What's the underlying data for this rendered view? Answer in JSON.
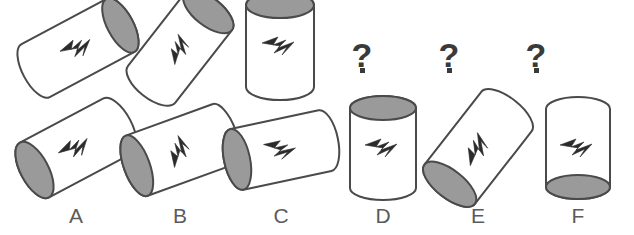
{
  "puzzle": {
    "type": "mental-rotation-multiple-choice",
    "background_color": "#ffffff",
    "stroke_color": "#4a4a4a",
    "body_fill": "#ffffff",
    "cap_fill": "#9a9a9a",
    "bolt_fill": "#2b2b2b",
    "label_color": "#5b5b5b",
    "question_mark_color": "#3a3a3a"
  },
  "top_row": {
    "name": "question-sequence",
    "items": [
      {
        "id": "q1",
        "kind": "cylinder",
        "x": 78,
        "y": 48,
        "rotation_deg": -28,
        "cap_side": "right",
        "bolt_angle_deg": -20,
        "bolt_scale": 1.0,
        "rx": 48,
        "ry": 30,
        "cap_rx": 13,
        "cap_ry": 30
      },
      {
        "id": "q2",
        "kind": "cylinder",
        "x": 180,
        "y": 48,
        "rotation_deg": -52,
        "cap_side": "right",
        "bolt_angle_deg": -82,
        "bolt_scale": 0.95,
        "rx": 46,
        "ry": 30,
        "cap_rx": 14,
        "cap_ry": 30
      },
      {
        "id": "q3",
        "kind": "cylinder",
        "x": 280,
        "y": 46,
        "rotation_deg": -90,
        "cap_side": "right",
        "bolt_angle_deg": 0,
        "bolt_scale": 1.0,
        "rx": 41,
        "ry": 34,
        "cap_rx": 13,
        "cap_ry": 34
      },
      {
        "id": "q4",
        "kind": "question-mark",
        "label": "?",
        "x": 362,
        "y": 38
      },
      {
        "id": "q5",
        "kind": "question-mark",
        "label": "?",
        "x": 449,
        "y": 38
      },
      {
        "id": "q6",
        "kind": "question-mark",
        "label": "?",
        "x": 536,
        "y": 38
      }
    ]
  },
  "bottom_row": {
    "name": "answer-options",
    "options": [
      {
        "id": "A",
        "label": "A",
        "x": 76,
        "y": 148,
        "label_x": 76,
        "label_y": 205,
        "rotation_deg": 152,
        "cap_side": "right",
        "bolt_angle_deg": -25,
        "bolt_scale": 1.0,
        "rx": 47,
        "ry": 31,
        "cap_rx": 14,
        "cap_ry": 31
      },
      {
        "id": "B",
        "label": "B",
        "x": 180,
        "y": 150,
        "label_x": 180,
        "label_y": 205,
        "rotation_deg": 160,
        "cap_side": "right",
        "bolt_angle_deg": -82,
        "bolt_scale": 1.0,
        "rx": 46,
        "ry": 32,
        "cap_rx": 13,
        "cap_ry": 32
      },
      {
        "id": "C",
        "label": "C",
        "x": 281,
        "y": 150,
        "label_x": 281,
        "label_y": 205,
        "rotation_deg": 168,
        "cap_side": "right",
        "bolt_angle_deg": 8,
        "bolt_scale": 1.0,
        "rx": 45,
        "ry": 31,
        "cap_rx": 13,
        "cap_ry": 31
      },
      {
        "id": "D",
        "label": "D",
        "x": 383,
        "y": 148,
        "label_x": 383,
        "label_y": 205,
        "rotation_deg": -90,
        "cap_side": "right",
        "bolt_angle_deg": 0,
        "bolt_scale": 1.0,
        "rx": 40,
        "ry": 33,
        "cap_rx": 12,
        "cap_ry": 33
      },
      {
        "id": "E",
        "label": "E",
        "x": 478,
        "y": 148,
        "label_x": 478,
        "label_y": 205,
        "rotation_deg": 128,
        "cap_side": "right",
        "bolt_angle_deg": -76,
        "bolt_scale": 1.05,
        "rx": 46,
        "ry": 32,
        "cap_rx": 14,
        "cap_ry": 32
      },
      {
        "id": "F",
        "label": "F",
        "x": 578,
        "y": 148,
        "label_x": 578,
        "label_y": 205,
        "rotation_deg": 90,
        "cap_side": "right",
        "bolt_angle_deg": 0,
        "bolt_scale": 1.0,
        "rx": 39,
        "ry": 32,
        "cap_rx": 12,
        "cap_ry": 32
      }
    ]
  }
}
